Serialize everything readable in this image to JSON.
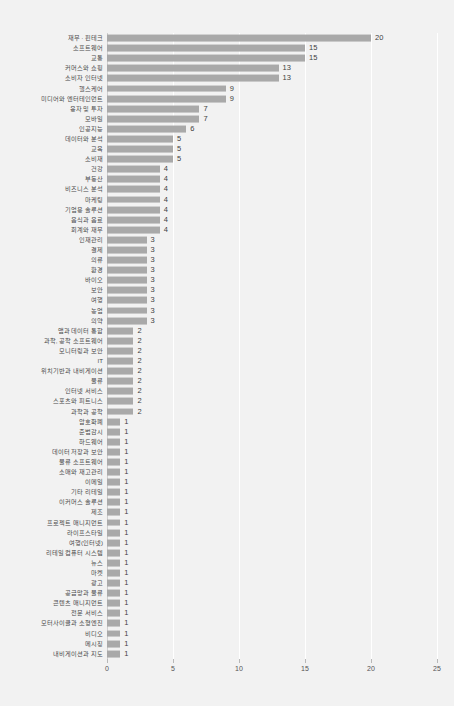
{
  "chart_data": {
    "type": "bar",
    "orientation": "horizontal",
    "title": "",
    "subtitle": "",
    "xlabel": "",
    "ylabel": "",
    "xlim": [
      0,
      25
    ],
    "xticks": [
      0,
      5,
      10,
      15,
      20,
      25
    ],
    "xtick_labels": [
      "0",
      "5",
      "10",
      "15",
      "20",
      "25"
    ],
    "grid": true,
    "grid_axis": "x",
    "legend": false,
    "bar_color": "#a9a9a9",
    "background_color": "#f2f2f2",
    "gridline_color": "#ffffff",
    "label_color": "#4a4a4a",
    "value_label_color": "#3f3f3f",
    "show_value_labels": true,
    "categories": [
      "재무 · 핀테크",
      "소프트웨어",
      "교통",
      "커머스와 쇼핑",
      "소비자 인터넷",
      "헬스케어",
      "미디어와 엔터테인먼트",
      "융자 및 투자",
      "모바일",
      "인공지능",
      "데이터와 분석",
      "교육",
      "소비재",
      "건강",
      "부동산",
      "비즈니스 분석",
      "마케팅",
      "기업용 솔루션",
      "음식과 음료",
      "회계와 재무",
      "인재관리",
      "결제",
      "의류",
      "환경",
      "바이오",
      "보안",
      "여행",
      "농업",
      "의약",
      "앱과 데이터 통합",
      "과학, 공학 소프트웨어",
      "모니터링과 보안",
      "IT",
      "위치기반과 내비게이션",
      "물류",
      "인터넷 서비스",
      "스포츠와 피트니스",
      "과학과 공학",
      "암호화폐",
      "준법감시",
      "하드웨어",
      "데이터 저장과 보안",
      "물류 소프트웨어",
      "소매와 재고관리",
      "이메일",
      "기타 리테일",
      "이커머스 솔루션",
      "제조",
      "프로젝트 매니지먼트",
      "라이프스타일",
      "여행(인터넷)",
      "리테일 컴퓨터 시스템",
      "뉴스",
      "마켓",
      "광고",
      "공급망과 물류",
      "콘텐츠 매니지먼트",
      "전문 서비스",
      "모터사이클과 소형엔진",
      "비디오",
      "메시징",
      "내비게이션과 지도"
    ],
    "values": [
      20,
      15,
      15,
      13,
      13,
      9,
      9,
      7,
      7,
      6,
      5,
      5,
      5,
      4,
      4,
      4,
      4,
      4,
      4,
      4,
      3,
      3,
      3,
      3,
      3,
      3,
      3,
      3,
      3,
      2,
      2,
      2,
      2,
      2,
      2,
      2,
      2,
      2,
      1,
      1,
      1,
      1,
      1,
      1,
      1,
      1,
      1,
      1,
      1,
      1,
      1,
      1,
      1,
      1,
      1,
      1,
      1,
      1,
      1,
      1,
      1,
      1
    ]
  }
}
